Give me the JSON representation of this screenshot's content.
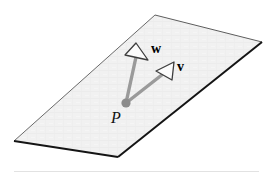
{
  "figure": {
    "name": "plane-with-two-vectors",
    "background_color": "#ffffff",
    "plane": {
      "name": "plane-parallelogram",
      "fill_color": "#f0f0f0",
      "stroke_color": "#1a1a1a",
      "corners": [
        [
          155,
          15
        ],
        [
          262,
          42
        ],
        [
          118,
          157
        ],
        [
          14,
          141
        ]
      ]
    },
    "point": {
      "label": "P",
      "x": 126,
      "y": 103,
      "dot_color": "#8a8a8a",
      "dot_radius": 4.5
    },
    "vectors": [
      {
        "label": "w",
        "from": [
          126,
          103
        ],
        "to": [
          135,
          49
        ],
        "shaft_color": "#9a9a9a",
        "head_fill": "#ffffff",
        "head_stroke": "#3a3a3a"
      },
      {
        "label": "v",
        "from": [
          126,
          103
        ],
        "to": [
          168,
          66
        ],
        "shaft_color": "#9a9a9a",
        "head_fill": "#ffffff",
        "head_stroke": "#3a3a3a"
      }
    ],
    "baseline_rule": {
      "color": "#e2e2e2"
    }
  }
}
